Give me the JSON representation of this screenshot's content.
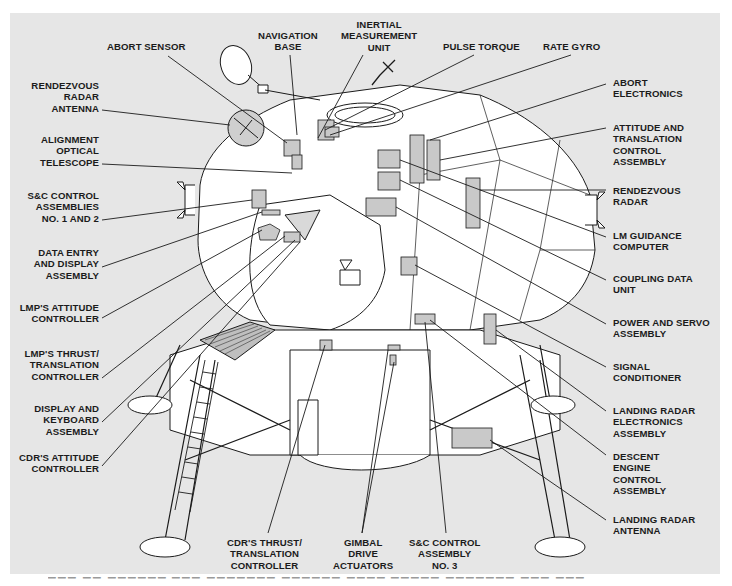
{
  "diagram": {
    "background_color": "#e6e6e6",
    "line_color": "#1b1b1b",
    "component_fill": "#c9c9c9"
  },
  "labels": {
    "top": [
      {
        "id": "abort-sensor",
        "text": "ABORT SENSOR"
      },
      {
        "id": "navigation-base",
        "text": "NAVIGATION\nBASE"
      },
      {
        "id": "inertial-measurement-unit",
        "text": "INERTIAL\nMEASUREMENT\nUNIT"
      },
      {
        "id": "pulse-torque",
        "text": "PULSE TORQUE"
      },
      {
        "id": "rate-gyro",
        "text": "RATE GYRO"
      }
    ],
    "left": [
      {
        "id": "rendezvous-radar-antenna",
        "text": "RENDEZVOUS\nRADAR\nANTENNA"
      },
      {
        "id": "alignment-optical-telescope",
        "text": "ALIGNMENT\nOPTICAL\nTELESCOPE"
      },
      {
        "id": "sc-control-assemblies-1-2",
        "text": "S&C CONTROL\nASSEMBLIES\nNO. 1 AND 2"
      },
      {
        "id": "data-entry-display-assembly",
        "text": "DATA ENTRY\nAND DISPLAY\nASSEMBLY"
      },
      {
        "id": "lmp-attitude-controller",
        "text": "LMP'S ATTITUDE\nCONTROLLER"
      },
      {
        "id": "lmp-thrust-translation-controller",
        "text": "LMP'S THRUST/\nTRANSLATION\nCONTROLLER"
      },
      {
        "id": "display-keyboard-assembly",
        "text": "DISPLAY AND\nKEYBOARD\nASSEMBLY"
      },
      {
        "id": "cdr-attitude-controller",
        "text": "CDR'S ATTITUDE\nCONTROLLER"
      }
    ],
    "right": [
      {
        "id": "abort-electronics",
        "text": "ABORT\nELECTRONICS"
      },
      {
        "id": "attitude-translation-control-assembly",
        "text": "ATTITUDE AND\nTRANSLATION\nCONTROL\nASSEMBLY"
      },
      {
        "id": "rendezvous-radar",
        "text": "RENDEZVOUS\nRADAR"
      },
      {
        "id": "lm-guidance-computer",
        "text": "LM GUIDANCE\nCOMPUTER"
      },
      {
        "id": "coupling-data-unit",
        "text": "COUPLING DATA\nUNIT"
      },
      {
        "id": "power-servo-assembly",
        "text": "POWER AND SERVO\nASSEMBLY"
      },
      {
        "id": "signal-conditioner",
        "text": "SIGNAL\nCONDITIONER"
      },
      {
        "id": "landing-radar-electronics-assembly",
        "text": "LANDING RADAR\nELECTRONICS\nASSEMBLY"
      },
      {
        "id": "descent-engine-control-assembly",
        "text": "DESCENT\nENGINE\nCONTROL\nASSEMBLY"
      },
      {
        "id": "landing-radar-antenna",
        "text": "LANDING RADAR\nANTENNA"
      }
    ],
    "bottom": [
      {
        "id": "cdr-thrust-translation-controller",
        "text": "CDR'S THRUST/\nTRANSLATION\nCONTROLLER"
      },
      {
        "id": "gimbal-drive-actuators",
        "text": "GIMBAL\nDRIVE\nACTUATORS"
      },
      {
        "id": "sc-control-assembly-3",
        "text": "S&C CONTROL\nASSEMBLY\nNO. 3"
      }
    ]
  }
}
